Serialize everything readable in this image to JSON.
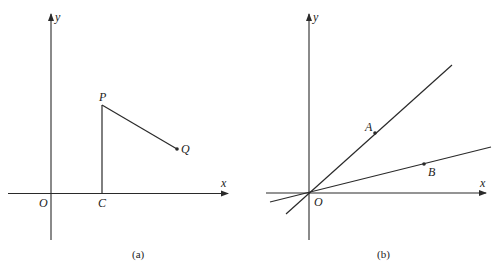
{
  "panels": [
    {
      "caption": "(a)",
      "axes": {
        "x_label": "x",
        "y_label": "y",
        "origin_label": "O"
      },
      "points": {
        "P": {
          "label": "P"
        },
        "Q": {
          "label": "Q"
        },
        "C": {
          "label": "C"
        }
      },
      "segments": [
        "C-P (vertical)",
        "P-Q"
      ]
    },
    {
      "caption": "(b)",
      "axes": {
        "x_label": "x",
        "y_label": "y",
        "origin_label": "O"
      },
      "points": {
        "A": {
          "label": "A"
        },
        "B": {
          "label": "B"
        }
      },
      "lines": [
        "Line through O and A",
        "Line through O and B"
      ]
    }
  ],
  "colors": {
    "ink": "#2a2a2a",
    "background": "#ffffff"
  }
}
